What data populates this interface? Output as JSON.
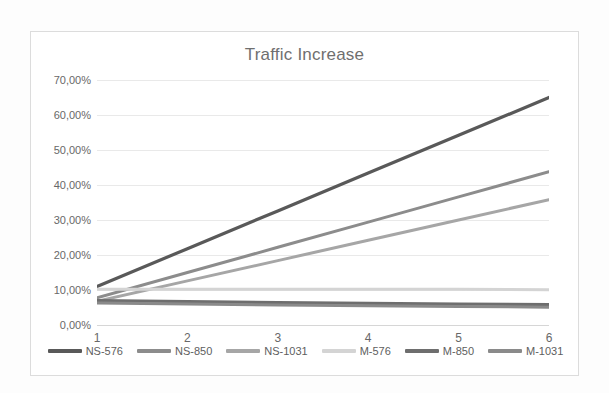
{
  "chart_data": {
    "type": "line",
    "title": "Traffic Increase",
    "xlabel": "",
    "ylabel": "",
    "x": [
      1,
      2,
      3,
      4,
      5,
      6
    ],
    "categories": [
      "1",
      "2",
      "3",
      "4",
      "5",
      "6"
    ],
    "xtick_labels": [
      "1",
      "2",
      "3",
      "4",
      "5",
      "6"
    ],
    "ytick_labels": [
      "70,00%",
      "60,00%",
      "50,00%",
      "40,00%",
      "30,00%",
      "20,00%",
      "10,00%",
      "0,00%"
    ],
    "ytick_values": [
      70,
      60,
      50,
      40,
      30,
      20,
      10,
      0
    ],
    "ylim": [
      0,
      70
    ],
    "xlim": [
      1,
      6
    ],
    "grid": true,
    "grid_axis": "y",
    "legend_position": "bottom",
    "value_unit": "%",
    "decimal_separator": ",",
    "series": [
      {
        "name": "NS-576",
        "color": "#595959",
        "width": 3.2,
        "values": [
          11.0,
          21.8,
          32.6,
          43.4,
          54.2,
          65.0
        ]
      },
      {
        "name": "NS-850",
        "color": "#8c8c8c",
        "width": 3.0,
        "values": [
          7.8,
          15.0,
          22.2,
          29.4,
          36.6,
          43.8
        ]
      },
      {
        "name": "NS-1031",
        "color": "#a6a6a6",
        "width": 3.0,
        "values": [
          6.8,
          12.6,
          18.4,
          24.2,
          30.0,
          35.8
        ]
      },
      {
        "name": "M-576",
        "color": "#d4d4d4",
        "width": 3.0,
        "values": [
          10.2,
          10.2,
          10.2,
          10.2,
          10.2,
          10.1
        ]
      },
      {
        "name": "M-850",
        "color": "#6e6e6e",
        "width": 3.2,
        "values": [
          7.0,
          6.7,
          6.4,
          6.2,
          6.0,
          5.8
        ]
      },
      {
        "name": "M-1031",
        "color": "#8a8a8a",
        "width": 3.0,
        "values": [
          6.3,
          6.0,
          5.7,
          5.5,
          5.3,
          5.1
        ]
      }
    ]
  },
  "chart": {
    "title": "Traffic Increase"
  }
}
